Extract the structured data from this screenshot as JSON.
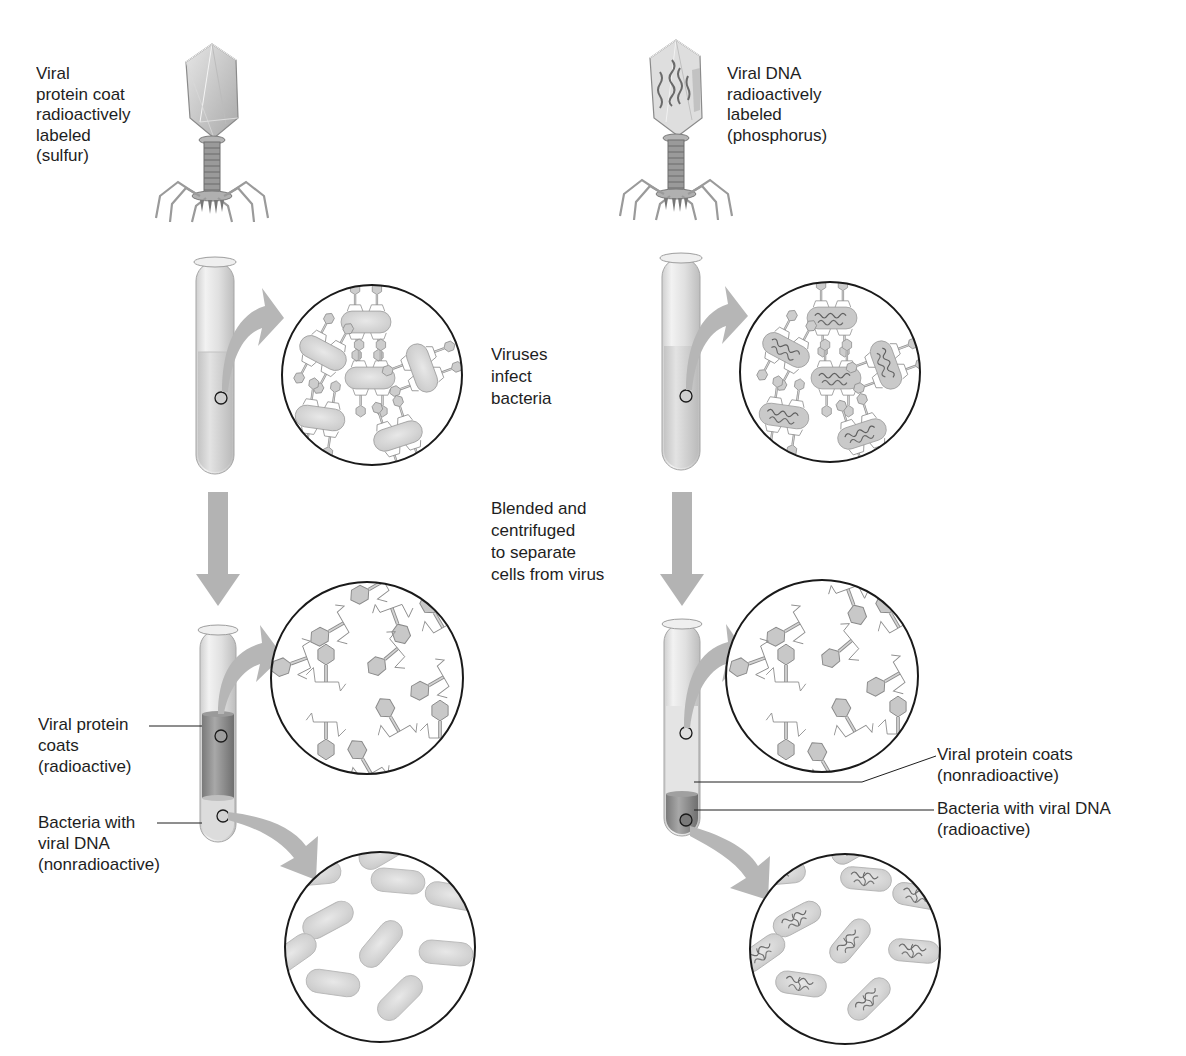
{
  "diagram": {
    "topic": "Hershey-Chase experiment",
    "colors": {
      "background": "#ffffff",
      "arrow_gray": "#b3b3b3",
      "virus_fill": "#c9c9c9",
      "virus_stroke": "#8a8a8a",
      "bacteria_fill": "#d6d6d6",
      "dna_stroke": "#6e6e6e",
      "circle_stroke": "#1a1a1a",
      "tube_glass": "#e4e4e4",
      "liquid_light": "#d9d9d9",
      "liquid_dark": "#8c8c8c",
      "text": "#1e1e1e"
    },
    "left_experiment": {
      "phage_label": [
        "Viral",
        "protein coat",
        "radioactively",
        "labeled",
        "(sulfur)"
      ],
      "phage_contents": "empty capsid (protein labeled)",
      "infect_circle": "phages attached to bacteria, no DNA visible inside bacteria",
      "supernatant_circle": "free viral protein coats",
      "pellet_circle": "plain bacteria",
      "supernatant_label": [
        "Viral protein",
        "coats",
        "(radioactive)"
      ],
      "pellet_label": [
        "Bacteria with",
        "viral DNA",
        "(nonradioactive)"
      ],
      "dark_layer": "supernatant"
    },
    "right_experiment": {
      "phage_label": [
        "Viral DNA",
        "radioactively",
        "labeled",
        "(phosphorus)"
      ],
      "phage_contents": "capsid containing DNA strands",
      "infect_circle": "phages attached to bacteria, DNA inside bacteria",
      "supernatant_circle": "free viral protein coats",
      "pellet_circle": "bacteria containing viral DNA",
      "supernatant_label": [
        "Viral protein coats",
        "(nonradioactive)"
      ],
      "pellet_label": [
        "Bacteria with viral DNA",
        "(radioactive)"
      ],
      "dark_layer": "pellet"
    },
    "center_steps": {
      "step1": [
        "Viruses",
        "infect",
        "bacteria"
      ],
      "step2": [
        "Blended and",
        "centrifuged",
        "to separate",
        "cells from virus"
      ]
    }
  }
}
